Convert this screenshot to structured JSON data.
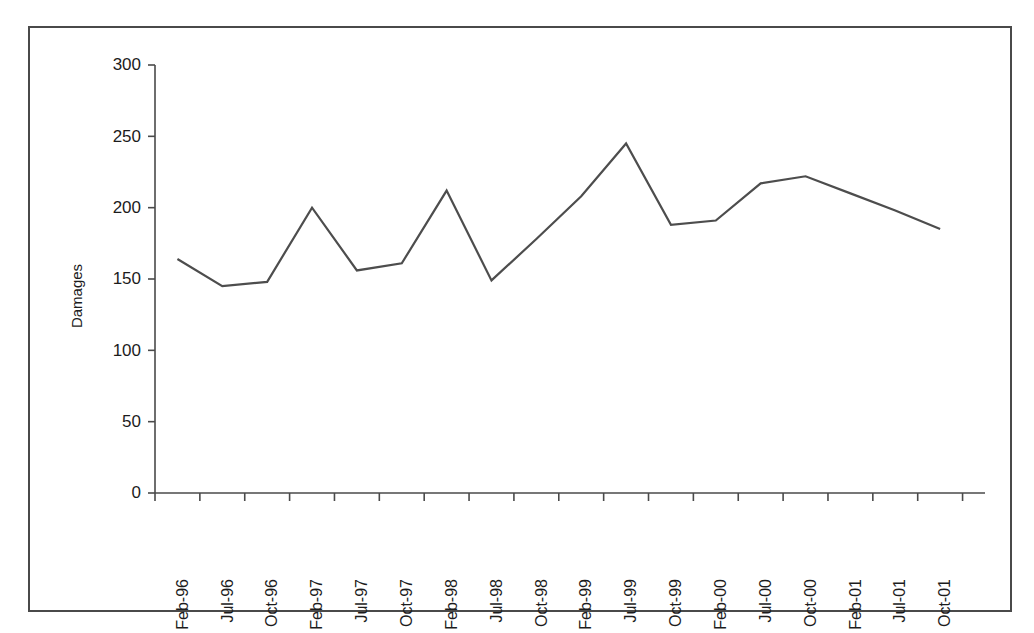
{
  "chart_data": {
    "type": "line",
    "title": "",
    "xlabel": "",
    "ylabel": "Damages",
    "ylim": [
      0,
      300
    ],
    "yticks": [
      0,
      50,
      100,
      150,
      200,
      250,
      300
    ],
    "ytick_labels": [
      "0",
      "50",
      "100",
      "150",
      "200",
      "250",
      "300"
    ],
    "grid": false,
    "legend": false,
    "categories": [
      "Feb-96",
      "Jul-96",
      "Oct-96",
      "Feb-97",
      "Jul-97",
      "Oct-97",
      "Feb-98",
      "Jul-98",
      "Oct-98",
      "Feb-99",
      "Jul-99",
      "Oct-99",
      "Feb-00",
      "Jul-00",
      "Oct-00",
      "Feb-01",
      "Jul-01",
      "Oct-01"
    ],
    "series": [
      {
        "name": "Damages",
        "color": "#4d4d4d",
        "values": [
          164,
          145,
          148,
          200,
          156,
          161,
          212,
          149,
          178,
          208,
          245,
          188,
          191,
          217,
          222,
          210,
          198,
          185
        ]
      }
    ]
  },
  "figure": {
    "border_color": "#4a4a4a",
    "background": "#ffffff",
    "axis_color": "#4a4a4a",
    "text_color": "#1c1c1c"
  }
}
